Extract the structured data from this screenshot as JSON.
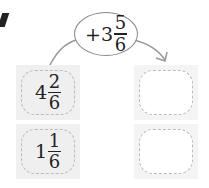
{
  "operation": {
    "sign": "+",
    "whole": "3",
    "numerator": "5",
    "denominator": "6"
  },
  "inputs": [
    {
      "whole": "4",
      "numerator": "2",
      "denominator": "6"
    },
    {
      "whole": "1",
      "numerator": "1",
      "denominator": "6"
    }
  ],
  "outputs": [
    {
      "value": ""
    },
    {
      "value": ""
    }
  ],
  "colors": {
    "box_bg": "#f0f0f0",
    "dash": "#bbbbbb",
    "arrow": "#999999"
  }
}
